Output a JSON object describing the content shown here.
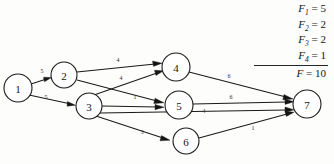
{
  "diagram": {
    "nodes": [
      {
        "id": "1",
        "label": "1",
        "cx": 18,
        "cy": 88,
        "r": 14
      },
      {
        "id": "2",
        "label": "2",
        "cx": 64,
        "cy": 75,
        "r": 13
      },
      {
        "id": "3",
        "label": "3",
        "cx": 89,
        "cy": 106,
        "r": 13
      },
      {
        "id": "4",
        "label": "4",
        "cx": 176,
        "cy": 67,
        "r": 14
      },
      {
        "id": "5",
        "label": "5",
        "cx": 179,
        "cy": 105,
        "r": 14
      },
      {
        "id": "6",
        "label": "6",
        "cx": 186,
        "cy": 141,
        "r": 13
      },
      {
        "id": "7",
        "label": "7",
        "cx": 307,
        "cy": 104,
        "r": 14
      }
    ],
    "edges": [
      {
        "id": "e-1-2",
        "from": "1",
        "to": "2",
        "label": "5",
        "lx": 42,
        "ly": 75
      },
      {
        "id": "e-1-3",
        "from": "1",
        "to": "3",
        "label": "5",
        "lx": 46,
        "ly": 101
      },
      {
        "id": "e-2-4",
        "from": "2",
        "to": "4",
        "label": "4",
        "lx": 118,
        "ly": 64
      },
      {
        "id": "e-2-5",
        "from": "2",
        "to": "5",
        "label": "4",
        "lx": 121,
        "ly": 81
      },
      {
        "id": "e-3-4",
        "from": "3",
        "to": "4",
        "label": "",
        "lx": 0,
        "ly": 0
      },
      {
        "id": "e-3-5",
        "from": "3",
        "to": "5",
        "label": "1",
        "lx": 135,
        "ly": 100
      },
      {
        "id": "e-3-6",
        "from": "3",
        "to": "6",
        "label": "3",
        "lx": 142,
        "ly": 135
      },
      {
        "id": "e-3-7",
        "from": "3",
        "to": "7",
        "label": "4",
        "lx": 204,
        "ly": 114
      },
      {
        "id": "e-4-7",
        "from": "4",
        "to": "7",
        "label": "6",
        "lx": 229,
        "ly": 79
      },
      {
        "id": "e-5-7",
        "from": "5",
        "to": "7",
        "label": "6",
        "lx": 231,
        "ly": 100
      },
      {
        "id": "e-6-7",
        "from": "6",
        "to": "7",
        "label": "1",
        "lx": 253,
        "ly": 131
      }
    ]
  },
  "legend": {
    "name": "flow-value-legend",
    "rows": [
      {
        "symbol": "F",
        "subscript": "1",
        "value": "= 5",
        "ruled": false
      },
      {
        "symbol": "F",
        "subscript": "2",
        "value": "= 2",
        "ruled": false
      },
      {
        "symbol": "F",
        "subscript": "3",
        "value": "= 2",
        "ruled": false
      },
      {
        "symbol": "F",
        "subscript": "4",
        "value": "= 1",
        "ruled": true
      }
    ],
    "total": {
      "symbol": "F",
      "subscript": "",
      "value": "= 10"
    }
  }
}
